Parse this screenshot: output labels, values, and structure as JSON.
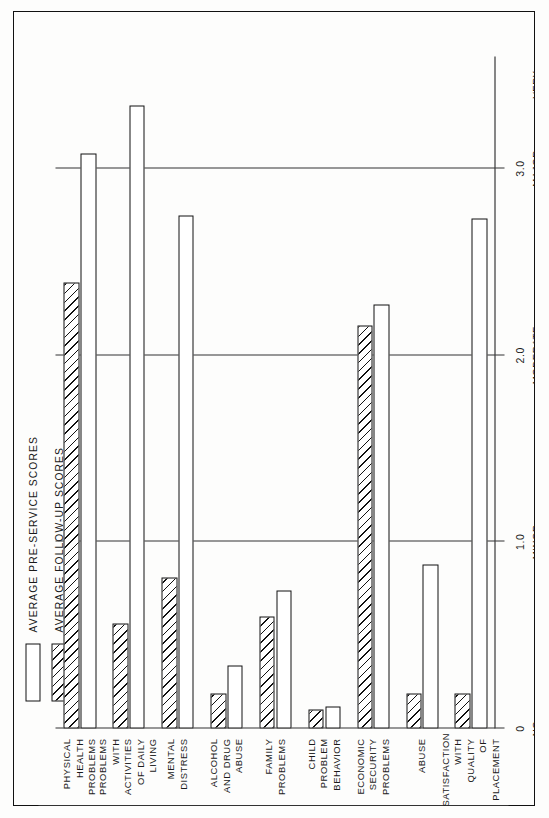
{
  "figure": {
    "orientation": "rotated-90-ccw"
  },
  "legend": {
    "items": [
      {
        "label": "AVERAGE  PRE-SERVICE  SCORES",
        "style": "open"
      },
      {
        "label": "AVERAGE  FOLLOW-UP  SCORES",
        "style": "hatched"
      }
    ]
  },
  "chart_data": {
    "type": "bar",
    "title": "",
    "subtitle": "",
    "xlabel": "",
    "ylabel": "",
    "orientation": "horizontal-rotated",
    "ylim": [
      0,
      3.6
    ],
    "grid": true,
    "legend_position": "left",
    "ticks": [
      "0",
      "1.0",
      "2.0",
      "3.0"
    ],
    "tick_values": [
      0,
      1.0,
      2.0,
      3.0
    ],
    "scale_anchors": [
      {
        "value": 0,
        "label": "NO\nPROBLEM"
      },
      {
        "value": 1.0,
        "label": "MINOR\nPROBLEMS"
      },
      {
        "value": 2.0,
        "label": "MODERATE\nPROBLEMS"
      },
      {
        "value": 3.0,
        "label": "MAJOR\nPROBLEMS"
      },
      {
        "value": 3.45,
        "label": "VERY\nSEVERE\nPROBLEMS"
      }
    ],
    "categories": [
      "PHYSICAL\nHEALTH\nPROBLEMS",
      "PROBLEMS\nWITH\nACTIVITIES\nOF DAILY\nLIVING",
      "MENTAL\nDISTRESS",
      "ALCOHOL\nAND DRUG\nABUSE",
      "FAMILY\nPROBLEMS",
      "CHILD\nPROBLEM\nBEHAVIOR",
      "ECONOMIC\nSECURITY\nPROBLEMS",
      "ABUSE",
      "SATISFACTION\nWITH QUALITY\nOF PLACEMENT"
    ],
    "series": [
      {
        "name": "AVERAGE  PRE-SERVICE  SCORES",
        "style": "open",
        "values": [
          3.08,
          3.34,
          2.75,
          0.34,
          0.74,
          0.12,
          2.27,
          0.88,
          2.73
        ]
      },
      {
        "name": "AVERAGE  FOLLOW-UP  SCORES",
        "style": "hatched",
        "values": [
          2.39,
          0.56,
          0.81,
          0.19,
          0.6,
          0.1,
          2.16,
          0.19,
          0.19
        ]
      }
    ]
  }
}
